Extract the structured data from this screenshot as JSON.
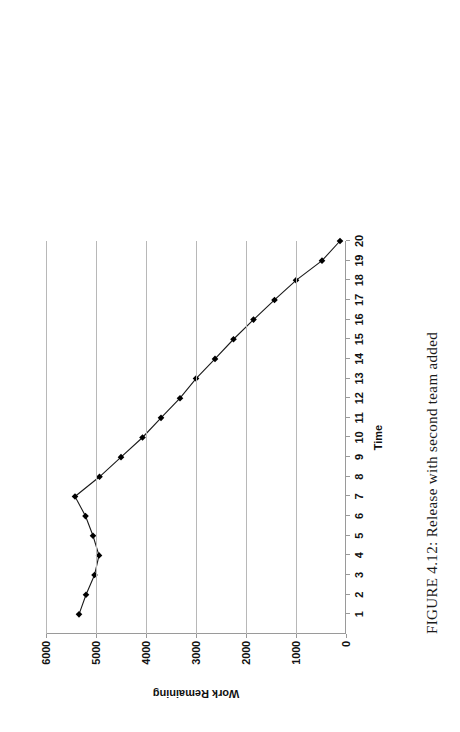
{
  "figure": {
    "caption": "FIGURE 4.12: Release with second team added"
  },
  "chart_data": {
    "type": "line",
    "title": "",
    "xlabel": "Time",
    "ylabel": "Work Remaining",
    "xlim": [
      0,
      20
    ],
    "ylim": [
      0,
      6000
    ],
    "grid": true,
    "grid_axis": "y",
    "legend": "none",
    "marker": "diamond",
    "marker_color": "#000000",
    "line_color": "#1a1a1a",
    "x_tick_labels": [
      "1",
      "2",
      "3",
      "4",
      "5",
      "6",
      "7",
      "8",
      "9",
      "10",
      "11",
      "12",
      "13",
      "14",
      "15",
      "16",
      "17",
      "18",
      "19",
      "20"
    ],
    "y_tick_labels": [
      "0",
      "1000",
      "2000",
      "3000",
      "4000",
      "5000",
      "6000"
    ],
    "y_ticks": [
      0,
      1000,
      2000,
      3000,
      4000,
      5000,
      6000
    ],
    "x": [
      1,
      2,
      3,
      4,
      5,
      6,
      7,
      8,
      9,
      10,
      11,
      12,
      13,
      14,
      15,
      16,
      17,
      18,
      19,
      20
    ],
    "values": [
      5340,
      5200,
      5030,
      4940,
      5060,
      5210,
      5420,
      4930,
      4500,
      4070,
      3700,
      3320,
      3000,
      2620,
      2250,
      1850,
      1430,
      1000,
      480,
      120
    ]
  }
}
